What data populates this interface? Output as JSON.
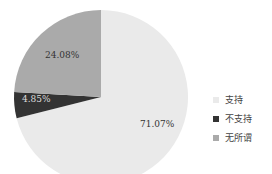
{
  "chart_data": {
    "type": "pie",
    "title": "",
    "start_angle": "12 o'clock",
    "direction": "clockwise",
    "categories": [
      "支持",
      "不支持",
      "无所谓"
    ],
    "values": [
      71.07,
      4.85,
      24.08
    ],
    "labels": [
      "71.07%",
      "4.85%",
      "24.08%"
    ],
    "colors": [
      "#eaeaea",
      "#333333",
      "#aaaaaa"
    ],
    "legend_position": "right"
  },
  "legend": {
    "items": [
      {
        "label": "支持",
        "color": "#eaeaea"
      },
      {
        "label": "不支持",
        "color": "#333333"
      },
      {
        "label": "无所谓",
        "color": "#aaaaaa"
      }
    ]
  }
}
